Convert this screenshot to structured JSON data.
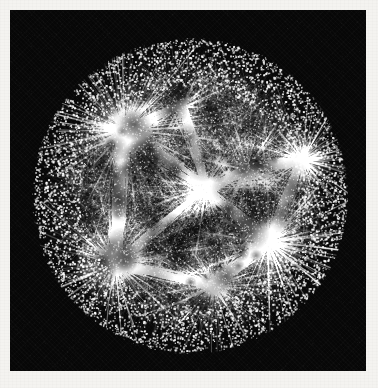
{
  "figure": {
    "kind": "network-graph-visualization",
    "layout": "hyperbolic-disk",
    "title": "",
    "caption": "",
    "background_color": "#f4f3f0",
    "panel_color": "#070707",
    "node_color": "#ffffff",
    "edge_color": "#e8e8e8",
    "panel": {
      "x": 10,
      "y": 10,
      "width": 356,
      "height": 361
    }
  },
  "chart_data": {
    "type": "scatter",
    "title": "",
    "xlabel": "",
    "ylabel": "",
    "xlim": [
      -1,
      1
    ],
    "ylim": [
      -1,
      1
    ],
    "grid": false,
    "legend": "none",
    "disk": {
      "center_x": 180,
      "center_y": 186,
      "radius": 156
    },
    "rings": [
      {
        "name": "core",
        "r_min": 0.0,
        "r_max": 0.34,
        "count": 2600,
        "dot_size": 0.8,
        "alpha": 0.55
      },
      {
        "name": "mid",
        "r_min": 0.34,
        "r_max": 0.7,
        "count": 3400,
        "dot_size": 1.0,
        "alpha": 0.7
      },
      {
        "name": "periphery",
        "r_min": 0.7,
        "r_max": 0.97,
        "count": 4200,
        "dot_size": 1.5,
        "alpha": 0.95
      },
      {
        "name": "rim",
        "r_min": 0.97,
        "r_max": 1.0,
        "count": 900,
        "dot_size": 1.4,
        "alpha": 0.85
      }
    ],
    "hubs": [
      {
        "name": "hub-upper-left",
        "x": 115,
        "y": 120,
        "glow_radius": 46,
        "spokes": 150,
        "spoke_len": 90,
        "intensity": 1.0
      },
      {
        "name": "hub-left-lower",
        "x": 105,
        "y": 253,
        "glow_radius": 40,
        "spokes": 130,
        "spoke_len": 82,
        "intensity": 0.95
      },
      {
        "name": "hub-right",
        "x": 292,
        "y": 150,
        "glow_radius": 30,
        "spokes": 120,
        "spoke_len": 74,
        "intensity": 0.92
      },
      {
        "name": "hub-right-lower",
        "x": 258,
        "y": 232,
        "glow_radius": 36,
        "spokes": 130,
        "spoke_len": 84,
        "intensity": 0.95
      },
      {
        "name": "hub-bottom",
        "x": 204,
        "y": 276,
        "glow_radius": 26,
        "spokes": 110,
        "spoke_len": 70,
        "intensity": 0.88
      },
      {
        "name": "hub-center",
        "x": 196,
        "y": 178,
        "glow_radius": 22,
        "spokes": 120,
        "spoke_len": 86,
        "intensity": 0.8
      },
      {
        "name": "hub-mid-right",
        "x": 236,
        "y": 160,
        "glow_radius": 18,
        "spokes": 90,
        "spoke_len": 62,
        "intensity": 0.72
      },
      {
        "name": "hub-top",
        "x": 172,
        "y": 96,
        "glow_radius": 16,
        "spokes": 80,
        "spoke_len": 58,
        "intensity": 0.66
      }
    ],
    "bundles": [
      {
        "from": "hub-upper-left",
        "to": "hub-left-lower",
        "strands": 70,
        "width": 18
      },
      {
        "from": "hub-upper-left",
        "to": "hub-center",
        "strands": 60,
        "width": 16
      },
      {
        "from": "hub-center",
        "to": "hub-right-lower",
        "strands": 60,
        "width": 14
      },
      {
        "from": "hub-right",
        "to": "hub-right-lower",
        "strands": 50,
        "width": 12
      },
      {
        "from": "hub-left-lower",
        "to": "hub-bottom",
        "strands": 55,
        "width": 14
      },
      {
        "from": "hub-bottom",
        "to": "hub-right-lower",
        "strands": 50,
        "width": 12
      },
      {
        "from": "hub-center",
        "to": "hub-mid-right",
        "strands": 45,
        "width": 10
      },
      {
        "from": "hub-top",
        "to": "hub-center",
        "strands": 40,
        "width": 10
      },
      {
        "from": "hub-upper-left",
        "to": "hub-top",
        "strands": 35,
        "width": 9
      },
      {
        "from": "hub-mid-right",
        "to": "hub-right",
        "strands": 35,
        "width": 9
      },
      {
        "from": "hub-left-lower",
        "to": "hub-center",
        "strands": 45,
        "width": 11
      }
    ],
    "edge_counts": {
      "total_nodes": 11100,
      "total_edges": 9400
    },
    "annotations": []
  }
}
